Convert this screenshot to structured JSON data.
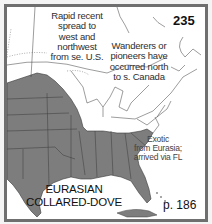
{
  "map": {
    "number": "235",
    "species_name_line1": "EURASIAN",
    "species_name_line2": "COLLARED-DOVE",
    "page_reference": "p. 186",
    "notes": {
      "west_spread": [
        "Rapid recent",
        "spread to",
        "west and",
        "northwest",
        "from se. U.S."
      ],
      "north_wanderers": [
        "Wanderers or",
        "pioneers have",
        "occurred north",
        "to s. Canada"
      ],
      "origin": [
        "Exotic",
        "from Eurasia;",
        "arrived via FL"
      ]
    },
    "colors": {
      "range_fill": "#7d7d7d",
      "border_lines": "#3a3a3a",
      "frame": "#6f6f6f",
      "background": "#ffffff"
    },
    "legend_meaning": {
      "shaded": "year-round range"
    }
  }
}
